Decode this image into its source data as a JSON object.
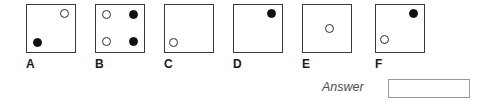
{
  "figure": {
    "name": "multiple-choice-dot-pattern-options",
    "box_size": 50,
    "options": [
      {
        "label": "A",
        "x": 26,
        "dots": [
          {
            "type": "open",
            "left": 33,
            "top": 4
          },
          {
            "type": "filled",
            "left": 6,
            "top": 33
          }
        ]
      },
      {
        "label": "B",
        "x": 95,
        "dots": [
          {
            "type": "open",
            "left": 6,
            "top": 5
          },
          {
            "type": "filled",
            "left": 33,
            "top": 5
          },
          {
            "type": "open",
            "left": 6,
            "top": 32
          },
          {
            "type": "filled",
            "left": 33,
            "top": 32
          }
        ]
      },
      {
        "label": "C",
        "x": 164,
        "dots": [
          {
            "type": "open",
            "left": 4,
            "top": 33
          }
        ]
      },
      {
        "label": "D",
        "x": 233,
        "dots": [
          {
            "type": "filled",
            "left": 33,
            "top": 4
          }
        ]
      },
      {
        "label": "E",
        "x": 302,
        "dots": [
          {
            "type": "open",
            "left": 22,
            "top": 19
          }
        ]
      },
      {
        "label": "F",
        "x": 375,
        "dots": [
          {
            "type": "filled",
            "left": 33,
            "top": 4
          },
          {
            "type": "open",
            "left": 4,
            "top": 30
          }
        ]
      }
    ]
  },
  "answer": {
    "label": "Answer",
    "value": "",
    "placeholder": ""
  }
}
